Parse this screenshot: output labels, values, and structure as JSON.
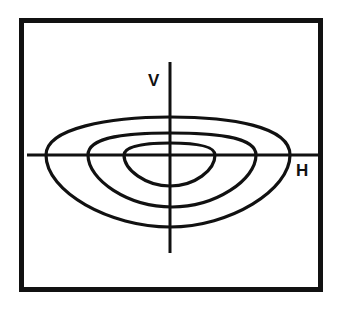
{
  "diagram": {
    "type": "contour-plot",
    "axes": {
      "vertical_label": "V",
      "horizontal_label": "H"
    },
    "contours": [
      {
        "name": "outer"
      },
      {
        "name": "middle"
      },
      {
        "name": "inner"
      }
    ],
    "colors": {
      "stroke": "#111111",
      "background": "#ffffff"
    }
  }
}
